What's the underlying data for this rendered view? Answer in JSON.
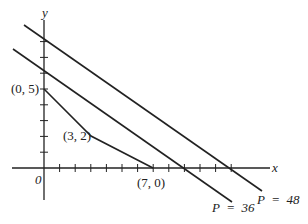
{
  "diagram": {
    "type": "linear-programming-feasible-region",
    "axes": {
      "x_label": "x",
      "y_label": "y",
      "origin_label": "0"
    },
    "vertices": [
      {
        "label": "(0, 5)",
        "x": 0,
        "y": 5
      },
      {
        "label": "(3, 2)",
        "x": 3,
        "y": 2
      },
      {
        "label": "(7, 0)",
        "x": 7,
        "y": 0
      }
    ],
    "objective_lines": [
      {
        "label": "P  =  36",
        "value": 36
      },
      {
        "label": "P  =  48",
        "value": 48
      }
    ],
    "colors": {
      "line": "#222222",
      "background": "#ffffff"
    }
  }
}
